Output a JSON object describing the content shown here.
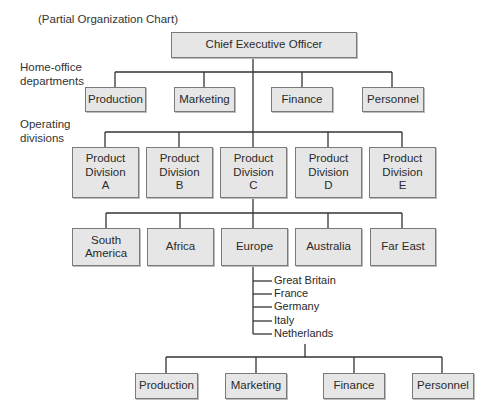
{
  "title": "(Partial Organization Chart)",
  "side_labels": {
    "home_office": "Home-office\ndepartments",
    "operating": "Operating\ndivisions"
  },
  "ceo": "Chief Executive Officer",
  "home_office_departments": [
    "Production",
    "Marketing",
    "Finance",
    "Personnel"
  ],
  "product_divisions": [
    "Product\nDivision\nA",
    "Product\nDivision\nB",
    "Product\nDivision\nC",
    "Product\nDivision\nD",
    "Product\nDivision\nE"
  ],
  "regions": [
    "South\nAmerica",
    "Africa",
    "Europe",
    "Australia",
    "Far East"
  ],
  "countries": [
    "Great Britain",
    "France",
    "Germany",
    "Italy",
    "Netherlands"
  ],
  "country_departments": [
    "Production",
    "Marketing",
    "Finance",
    "Personnel"
  ],
  "colors": {
    "box_fill": "#e6e6e6",
    "box_border": "#7a7a7a",
    "line": "#333333"
  }
}
